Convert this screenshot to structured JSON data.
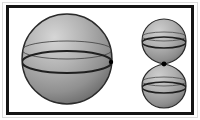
{
  "figure": {
    "type": "geometry-diagram",
    "background_color": "#ffffff",
    "frame": {
      "outer_rule_color": "#dcdcdc",
      "border_color": "#151515",
      "border_width_px": 3,
      "x": 6,
      "y": 5,
      "width": 188,
      "height": 110
    },
    "shading": {
      "style": "radial-gradient",
      "highlight_color": "#d4d4d4",
      "mid_color": "#a8a8a8",
      "shadow_color": "#6f6f6f",
      "outline_color": "#2a2a2a"
    },
    "shapes": [
      {
        "name": "large-sphere",
        "role": "primary sphere",
        "cx": 67,
        "cy": 59,
        "r": 45,
        "outline_width": 1.4,
        "equator": {
          "name": "equator-ellipse",
          "ry": 11,
          "stroke_width": 2.0,
          "stroke_color": "#1f1f1f"
        },
        "latitude_arc": {
          "name": "upper-latitude-arc",
          "offset_y": -9,
          "ry": 9,
          "stroke_width": 0.9,
          "stroke_color": "#4a4a4a"
        },
        "marked_point": {
          "name": "tangency-point-marker",
          "x": 111,
          "y": 62,
          "radius": 2.2,
          "color": "#000000"
        }
      },
      {
        "name": "small-sphere-upper",
        "role": "tangent sphere (top)",
        "cx": 164,
        "cy": 41,
        "r": 22,
        "outline_width": 1.2,
        "cusp": {
          "name": "lower-cusp",
          "x": 164,
          "y": 64
        },
        "equator": {
          "name": "equator-ellipse",
          "ry": 5.5,
          "stroke_width": 1.6,
          "stroke_color": "#1f1f1f"
        },
        "latitude_arc": {
          "name": "upper-latitude-arc",
          "offset_y": -4.5,
          "ry": 4.5,
          "stroke_width": 0.8,
          "stroke_color": "#4a4a4a"
        }
      },
      {
        "name": "small-sphere-lower",
        "role": "tangent sphere (bottom)",
        "cx": 164,
        "cy": 86,
        "r": 22,
        "outline_width": 1.2,
        "cusp": {
          "name": "upper-cusp",
          "x": 164,
          "y": 64
        },
        "equator": {
          "name": "equator-ellipse",
          "ry": 5.5,
          "stroke_width": 1.6,
          "stroke_color": "#1f1f1f"
        },
        "latitude_arc": {
          "name": "upper-latitude-arc",
          "offset_y": -4.5,
          "ry": 4.5,
          "stroke_width": 0.8,
          "stroke_color": "#4a4a4a"
        }
      }
    ],
    "contact_point": {
      "name": "sphere-contact-point",
      "x": 164,
      "y": 64,
      "radius": 2.4,
      "color": "#000000"
    }
  }
}
